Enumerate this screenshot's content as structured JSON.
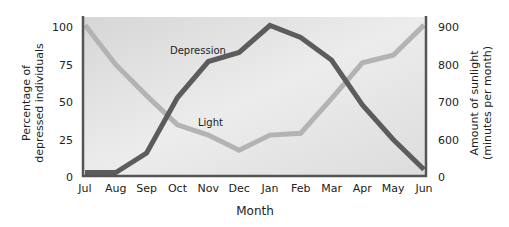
{
  "chart_data": {
    "type": "line",
    "title": "",
    "xlabel": "Month",
    "ylabel": "Percentage of depressed individuals",
    "ylabel_lines": [
      "Percentage of",
      "depressed individuals"
    ],
    "y2label": "Amount of sunlight (minutes per month)",
    "y2label_lines": [
      "Amount of sunlight",
      "(minutes per month)"
    ],
    "categories": [
      "Jul",
      "Aug",
      "Sep",
      "Oct",
      "Nov",
      "Dec",
      "Jan",
      "Feb",
      "Mar",
      "Apr",
      "May",
      "Jun"
    ],
    "ylim": [
      0,
      100
    ],
    "yticks": [
      0,
      25,
      50,
      75,
      100
    ],
    "y2ticks": [
      0,
      600,
      700,
      800,
      900
    ],
    "y2_axis_break": "0 then 600-900",
    "grid": false,
    "legend": "inline labels",
    "series": [
      {
        "name": "Depression",
        "axis": "left",
        "color": "#5c5c5c",
        "values": [
          3,
          3,
          16,
          53,
          77,
          83,
          101,
          93,
          78,
          48,
          25,
          5
        ]
      },
      {
        "name": "Light",
        "axis": "right",
        "color": "#b3b3b3",
        "values": [
          905,
          800,
          718,
          640,
          613,
          573,
          613,
          618,
          710,
          805,
          825,
          905
        ]
      }
    ],
    "annotations": [
      {
        "text": "Depression",
        "near": "Nov-Dec"
      },
      {
        "text": "Light",
        "near": "Nov"
      }
    ]
  },
  "labels": {
    "depression": "Depression",
    "light": "Light",
    "xtitle": "Month",
    "ytitle_1": "Percentage of",
    "ytitle_2": "depressed individuals",
    "y2title_1": "Amount of sunlight",
    "y2title_2": "(minutes per month)"
  },
  "colors": {
    "plot_bg_top": "#d9d9d9",
    "plot_bg_bottom": "#ececec",
    "axis": "#555555",
    "depression": "#5c5c5c",
    "light": "#b3b3b3"
  }
}
